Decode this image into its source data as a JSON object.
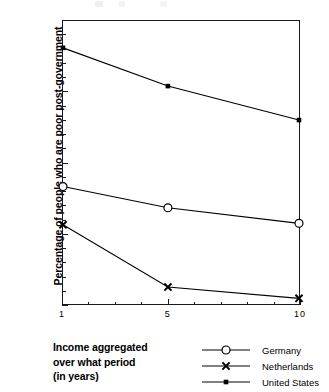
{
  "chart_data": {
    "type": "line",
    "title": "",
    "xlabel": "Income aggregated over what period (in years)",
    "ylabel": "Percentage of people who are poor post-government",
    "x": [
      1,
      5,
      10
    ],
    "xlim": [
      1,
      10
    ],
    "ylim": [
      0,
      20
    ],
    "xticks": [
      1,
      5,
      10
    ],
    "xtick_labels": [
      "1",
      "5",
      "10"
    ],
    "yticks": [
      0,
      5,
      10,
      15,
      20
    ],
    "ytick_labels": [
      "0",
      "5",
      "10",
      "15",
      "20"
    ],
    "x_minor_ticks": [
      2,
      3,
      4,
      6,
      7,
      8,
      9
    ],
    "y_minor_ticks": [
      1,
      2,
      3,
      4,
      6,
      7,
      8,
      9,
      11,
      12,
      13,
      14,
      16,
      17,
      18,
      19
    ],
    "grid": false,
    "legend_position": "bottom-right",
    "series": [
      {
        "name": "Germany",
        "marker": "open-circle",
        "values": [
          8.3,
          6.8,
          5.7
        ],
        "color": "#000000"
      },
      {
        "name": "Netherlands",
        "marker": "cross-x",
        "values": [
          5.6,
          1.2,
          0.4
        ],
        "color": "#000000"
      },
      {
        "name": "United States",
        "marker": "filled-square",
        "values": [
          18.1,
          15.4,
          13.0
        ],
        "color": "#000000"
      }
    ]
  },
  "axis": {
    "ylabel_text": "Percentage of people who are poor post-government",
    "ytick_labels": [
      "0",
      "5",
      "10",
      "15",
      "20"
    ],
    "xtick_labels": [
      "1",
      "5",
      "10"
    ]
  },
  "caption": {
    "line1": "Income aggregated",
    "line2": "over what period",
    "line3": "(in years)"
  },
  "legend": {
    "items": [
      {
        "label": "Germany",
        "marker": "open-circle"
      },
      {
        "label": "Netherlands",
        "marker": "cross-x"
      },
      {
        "label": "United States",
        "marker": "filled-square"
      }
    ]
  },
  "colors": {
    "ink": "#1a1a1a",
    "background": "#ffffff"
  }
}
